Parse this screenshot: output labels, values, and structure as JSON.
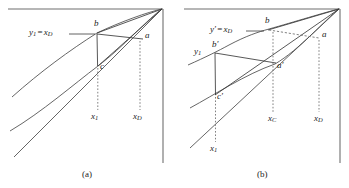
{
  "figure": {
    "type": "line-diagram",
    "panel_count": 2,
    "background": "#ffffff",
    "line_color": "#4a4a4a",
    "axis_color": "#6f6f6f"
  },
  "panel_a": {
    "caption": "(a)",
    "axis_label": "y₁ = x_D",
    "axis_label_parts": {
      "lhs_var": "y",
      "lhs_sub": "1",
      "op": "=",
      "rhs_var": "x",
      "rhs_sub": "D"
    },
    "points": [
      {
        "name": "b",
        "label": "b",
        "x": 97,
        "y": 33
      },
      {
        "name": "a",
        "label": "a",
        "x": 142,
        "y": 39
      },
      {
        "name": "c",
        "label": "c",
        "x": 98,
        "y": 66
      }
    ],
    "tick_labels": [
      {
        "name": "x1",
        "label": "x₁",
        "var": "x",
        "sub": "1",
        "x": 92,
        "y": 118
      },
      {
        "name": "xD",
        "label": "x_D",
        "var": "x",
        "sub": "D",
        "x": 134,
        "y": 118
      }
    ]
  },
  "panel_b": {
    "caption": "(b)",
    "axis_label": "y′ = x_D",
    "axis_label_parts": {
      "lhs_var": "y",
      "lhs_prime": "′",
      "op": "=",
      "rhs_var": "x",
      "rhs_sub": "D"
    },
    "y1_label": {
      "var": "y",
      "sub": "1"
    },
    "points": [
      {
        "name": "b-upper",
        "label": "b",
        "x": 93,
        "y": 30
      },
      {
        "name": "a-upper",
        "label": "a",
        "x": 146,
        "y": 38
      },
      {
        "name": "b-prime",
        "label": "b′",
        "x": 40,
        "y": 51
      },
      {
        "name": "a-prime",
        "label": "a′",
        "x": 101,
        "y": 64
      },
      {
        "name": "c-prime",
        "label": "c′",
        "x": 41,
        "y": 96
      }
    ],
    "tick_labels": [
      {
        "name": "x1",
        "label": "x₁",
        "var": "x",
        "sub": "1",
        "x": 36,
        "y": 150
      },
      {
        "name": "xC",
        "label": "x_C",
        "var": "x",
        "sub": "C",
        "x": 96,
        "y": 120
      },
      {
        "name": "xD",
        "label": "x_D",
        "var": "x",
        "sub": "D",
        "x": 141,
        "y": 120
      }
    ]
  }
}
